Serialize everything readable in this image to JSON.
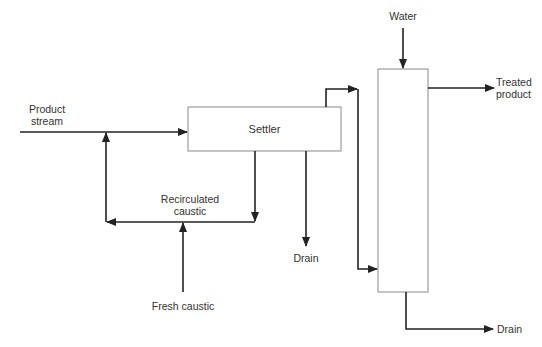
{
  "diagram": {
    "type": "process-flow",
    "units": {
      "settler": {
        "label": "Settler"
      },
      "column": {
        "label": ""
      }
    },
    "streams": {
      "product_stream": {
        "label_line1": "Product",
        "label_line2": "stream"
      },
      "recirculated_caustic": {
        "label_line1": "Recirculated",
        "label_line2": "caustic"
      },
      "fresh_caustic": {
        "label": "Fresh caustic"
      },
      "settler_drain": {
        "label": "Drain"
      },
      "water": {
        "label": "Water"
      },
      "treated_product": {
        "label_line1": "Treated",
        "label_line2": "product"
      },
      "column_drain": {
        "label": "Drain"
      }
    },
    "colors": {
      "line": "#222222",
      "box_border": "#8a8a8a",
      "text": "#333333"
    }
  }
}
